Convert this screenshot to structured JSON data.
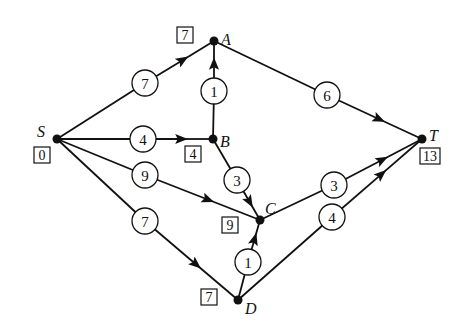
{
  "diagram": {
    "type": "directed-weighted-graph",
    "nodes": [
      {
        "id": "S",
        "label": "S",
        "x": 57,
        "y": 139,
        "distance": "0",
        "label_dx": -20,
        "label_dy": -2,
        "box_x": 34,
        "box_y": 147
      },
      {
        "id": "A",
        "label": "A",
        "x": 214,
        "y": 41,
        "distance": "7",
        "label_dx": 7,
        "label_dy": 4,
        "box_x": 177,
        "box_y": 27
      },
      {
        "id": "B",
        "label": "B",
        "x": 213,
        "y": 139,
        "distance": "4",
        "label_dx": 7,
        "label_dy": 8,
        "box_x": 185,
        "box_y": 146
      },
      {
        "id": "C",
        "label": "C",
        "x": 260,
        "y": 220,
        "distance": "9",
        "label_dx": 5,
        "label_dy": -6,
        "box_x": 222,
        "box_y": 217
      },
      {
        "id": "D",
        "label": "D",
        "x": 238,
        "y": 300,
        "distance": "7",
        "label_dx": 7,
        "label_dy": 14,
        "box_x": 201,
        "box_y": 289
      },
      {
        "id": "T",
        "label": "T",
        "x": 422,
        "y": 139,
        "distance": "13",
        "label_dx": 7,
        "label_dy": 2,
        "box_x": 420,
        "box_y": 148
      }
    ],
    "edges": [
      {
        "from": "S",
        "to": "A",
        "weight": "7",
        "cx": 145,
        "cy": 83
      },
      {
        "from": "S",
        "to": "B",
        "weight": "4",
        "cx": 143,
        "cy": 139
      },
      {
        "from": "S",
        "to": "C",
        "weight": "9",
        "cx": 145,
        "cy": 175
      },
      {
        "from": "S",
        "to": "D",
        "weight": "7",
        "cx": 145,
        "cy": 221
      },
      {
        "from": "B",
        "to": "A",
        "weight": "1",
        "cx": 214,
        "cy": 91
      },
      {
        "from": "B",
        "to": "C",
        "weight": "3",
        "cx": 237,
        "cy": 180
      },
      {
        "from": "D",
        "to": "C",
        "weight": "1",
        "cx": 248,
        "cy": 262
      },
      {
        "from": "A",
        "to": "T",
        "weight": "6",
        "cx": 327,
        "cy": 95
      },
      {
        "from": "C",
        "to": "T",
        "weight": "3",
        "cx": 334,
        "cy": 185
      },
      {
        "from": "D",
        "to": "T",
        "weight": "4",
        "cx": 332,
        "cy": 217
      }
    ]
  }
}
